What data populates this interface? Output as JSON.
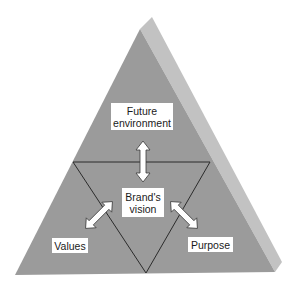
{
  "diagram": {
    "type": "pyramid",
    "colors": {
      "front_face": "#9b9b9b",
      "side_face": "#c2c2c2",
      "lines": "#2b2b2b",
      "label_bg": "#ffffff",
      "arrow_fill": "#ffffff"
    },
    "labels": {
      "future": {
        "line1": "Future",
        "line2": "environment"
      },
      "center": {
        "line1": "Brand's",
        "line2": "vision"
      },
      "values": "Values",
      "purpose": "Purpose"
    },
    "arrows": [
      {
        "from": "Brand's vision",
        "to": "Future environment",
        "direction": "bidirectional"
      },
      {
        "from": "Brand's vision",
        "to": "Values",
        "direction": "bidirectional"
      },
      {
        "from": "Brand's vision",
        "to": "Purpose",
        "direction": "bidirectional"
      }
    ]
  }
}
